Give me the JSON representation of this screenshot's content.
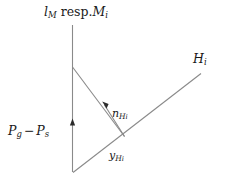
{
  "figure": {
    "kind": "geometry-diagram",
    "width": 233,
    "height": 176,
    "background_color": "#ffffff",
    "stroke_color": "#8a8a8a",
    "text_color": "#1a1a1a"
  },
  "labels": {
    "top": {
      "full_text": "l_M resp. M_i",
      "base1": "l",
      "sub1": "M",
      "word": "resp.",
      "base2": "M",
      "sub2": "i"
    },
    "hi": {
      "full_text": "H_i",
      "base": "H",
      "sub": "i"
    },
    "n_hi": {
      "full_text": "n_{H_i}",
      "base": "n",
      "sub": "H",
      "subsub": "i"
    },
    "y_hi": {
      "full_text": "y_{H_i}",
      "base": "y",
      "sub": "H",
      "subsub": "i"
    },
    "pressure": {
      "full_text": "P_g - P_s",
      "base1": "P",
      "sub1": "g",
      "operator": "−",
      "base2": "P",
      "sub2": "s"
    }
  },
  "geometry": {
    "vertical_line": {
      "x1": 72.5,
      "y1": 25,
      "x2": 72.5,
      "y2": 172
    },
    "branch_line": {
      "x1": 72.5,
      "y1": 67,
      "x2": 124,
      "y2": 136
    },
    "diagonal_line": {
      "x1": 73,
      "y1": 172,
      "x2": 201,
      "y2": 74
    },
    "normal_vector": {
      "x1": 124,
      "y1": 136,
      "x2": 103,
      "y2": 103
    },
    "vertical_arrow_tip": {
      "x": 72.5,
      "y": 119
    }
  }
}
